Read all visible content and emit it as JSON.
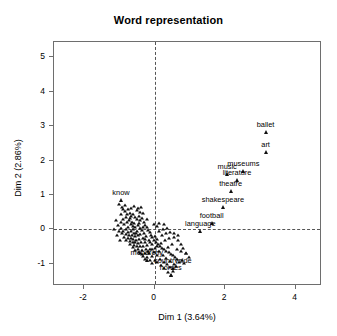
{
  "chart_data": {
    "type": "scatter",
    "title": "Word representation",
    "xlabel": "Dim 1 (3.64%)",
    "ylabel": "Dim 2 (2.86%)",
    "xlim": [
      -2.85,
      4.75
    ],
    "ylim": [
      -1.65,
      5.45
    ],
    "xticks": [
      "-2",
      "0",
      "2",
      "4"
    ],
    "xtick_values": [
      -2,
      0,
      2,
      4
    ],
    "yticks": [
      "-1",
      "0",
      "1",
      "2",
      "3",
      "4",
      "5"
    ],
    "ytick_values": [
      -1,
      0,
      1,
      2,
      3,
      4,
      5
    ],
    "grid": false,
    "reference_lines": {
      "vertical_x": 0,
      "horizontal_y": 0,
      "style": "dashed"
    },
    "marker": "triangle",
    "legend": "none",
    "labeled_points": [
      {
        "label": "ballet",
        "x": 3.15,
        "y": 2.82
      },
      {
        "label": "art",
        "x": 3.15,
        "y": 2.25
      },
      {
        "label": "museums",
        "x": 2.52,
        "y": 1.7
      },
      {
        "label": "music",
        "x": 2.06,
        "y": 1.62
      },
      {
        "label": "literature",
        "x": 2.34,
        "y": 1.43
      },
      {
        "label": "theatre",
        "x": 2.16,
        "y": 1.12
      },
      {
        "label": "shakespeare",
        "x": 1.94,
        "y": 0.66
      },
      {
        "label": "football",
        "x": 1.62,
        "y": 0.18
      },
      {
        "label": "language",
        "x": 1.3,
        "y": -0.05
      },
      {
        "label": "know",
        "x": -0.95,
        "y": 0.84
      },
      {
        "label": "monarchy",
        "x": -0.22,
        "y": -0.88
      },
      {
        "label": "countryside",
        "x": 0.52,
        "y": -1.12
      },
      {
        "label": "horses",
        "x": 0.46,
        "y": -1.32
      }
    ],
    "cluster_note": "dense unlabeled cluster of word points centered near (-0.3, -0.2)",
    "cluster_points": [
      [
        -1.02,
        0.74
      ],
      [
        -0.9,
        0.6
      ],
      [
        -0.84,
        0.52
      ],
      [
        -0.95,
        0.45
      ],
      [
        -0.76,
        0.58
      ],
      [
        -0.7,
        0.48
      ],
      [
        -0.66,
        0.4
      ],
      [
        -0.8,
        0.36
      ],
      [
        -0.88,
        0.3
      ],
      [
        -0.6,
        0.44
      ],
      [
        -0.55,
        0.35
      ],
      [
        -0.72,
        0.26
      ],
      [
        -0.64,
        0.22
      ],
      [
        -0.5,
        0.3
      ],
      [
        -0.45,
        0.4
      ],
      [
        -0.58,
        0.18
      ],
      [
        -0.68,
        0.14
      ],
      [
        -0.78,
        0.2
      ],
      [
        -0.86,
        0.16
      ],
      [
        -0.4,
        0.26
      ],
      [
        -0.35,
        0.34
      ],
      [
        -0.48,
        0.12
      ],
      [
        -0.54,
        0.06
      ],
      [
        -0.62,
        0.02
      ],
      [
        -0.74,
        0.06
      ],
      [
        -0.82,
        0.02
      ],
      [
        -0.3,
        0.2
      ],
      [
        -0.26,
        0.12
      ],
      [
        -0.42,
        0.04
      ],
      [
        -0.36,
        -0.02
      ],
      [
        -0.5,
        -0.06
      ],
      [
        -0.58,
        -0.1
      ],
      [
        -0.66,
        -0.06
      ],
      [
        -0.76,
        -0.08
      ],
      [
        -0.88,
        -0.04
      ],
      [
        -0.22,
        0.06
      ],
      [
        -0.18,
        -0.02
      ],
      [
        -0.3,
        -0.1
      ],
      [
        -0.4,
        -0.14
      ],
      [
        -0.48,
        -0.18
      ],
      [
        -0.56,
        -0.2
      ],
      [
        -0.64,
        -0.16
      ],
      [
        -0.72,
        -0.18
      ],
      [
        -0.8,
        -0.14
      ],
      [
        -0.14,
        -0.08
      ],
      [
        -0.1,
        -0.16
      ],
      [
        -0.24,
        -0.2
      ],
      [
        -0.34,
        -0.24
      ],
      [
        -0.44,
        -0.28
      ],
      [
        -0.52,
        -0.3
      ],
      [
        -0.6,
        -0.28
      ],
      [
        -0.68,
        -0.26
      ],
      [
        -0.76,
        -0.26
      ],
      [
        -0.06,
        -0.22
      ],
      [
        -0.02,
        -0.3
      ],
      [
        -0.16,
        -0.32
      ],
      [
        -0.28,
        -0.36
      ],
      [
        -0.38,
        -0.38
      ],
      [
        -0.46,
        -0.4
      ],
      [
        -0.54,
        -0.38
      ],
      [
        -0.62,
        -0.36
      ],
      [
        -0.7,
        -0.34
      ],
      [
        0.04,
        -0.36
      ],
      [
        0.1,
        -0.42
      ],
      [
        -0.08,
        -0.44
      ],
      [
        -0.2,
        -0.46
      ],
      [
        -0.32,
        -0.48
      ],
      [
        -0.42,
        -0.5
      ],
      [
        -0.5,
        -0.48
      ],
      [
        -0.58,
        -0.46
      ],
      [
        0.16,
        -0.48
      ],
      [
        0.22,
        -0.54
      ],
      [
        0.02,
        -0.54
      ],
      [
        -0.12,
        -0.56
      ],
      [
        -0.24,
        -0.58
      ],
      [
        -0.36,
        -0.6
      ],
      [
        -0.46,
        -0.58
      ],
      [
        0.28,
        -0.58
      ],
      [
        0.34,
        -0.64
      ],
      [
        0.12,
        -0.64
      ],
      [
        -0.02,
        -0.66
      ],
      [
        -0.16,
        -0.68
      ],
      [
        -0.28,
        -0.7
      ],
      [
        -0.4,
        -0.68
      ],
      [
        0.4,
        -0.66
      ],
      [
        0.46,
        -0.72
      ],
      [
        0.24,
        -0.74
      ],
      [
        0.06,
        -0.76
      ],
      [
        -0.08,
        -0.78
      ],
      [
        -0.22,
        -0.8
      ],
      [
        -0.34,
        -0.78
      ],
      [
        0.52,
        -0.76
      ],
      [
        0.58,
        -0.82
      ],
      [
        0.34,
        -0.84
      ],
      [
        0.16,
        -0.86
      ],
      [
        0.0,
        -0.88
      ],
      [
        -0.14,
        -0.9
      ],
      [
        -0.28,
        -0.86
      ],
      [
        0.64,
        -0.86
      ],
      [
        0.44,
        -0.92
      ],
      [
        0.26,
        -0.94
      ],
      [
        0.08,
        -0.96
      ],
      [
        -0.06,
        -0.98
      ],
      [
        0.7,
        -0.94
      ],
      [
        0.54,
        -1.0
      ],
      [
        0.36,
        -1.02
      ],
      [
        0.18,
        -1.04
      ],
      [
        0.62,
        -1.08
      ],
      [
        0.44,
        -1.1
      ],
      [
        0.28,
        -1.14
      ],
      [
        0.52,
        -1.2
      ],
      [
        0.38,
        -1.24
      ],
      [
        0.46,
        -1.34
      ],
      [
        -0.96,
        0.2
      ],
      [
        -1.04,
        0.12
      ],
      [
        -0.94,
        0.04
      ],
      [
        -1.0,
        -0.04
      ],
      [
        -0.92,
        -0.12
      ],
      [
        -0.86,
        -0.22
      ],
      [
        -0.8,
        -0.32
      ],
      [
        -0.7,
        -0.44
      ],
      [
        -0.62,
        -0.52
      ],
      [
        -0.54,
        -0.6
      ],
      [
        0.78,
        -0.9
      ],
      [
        0.84,
        -0.98
      ],
      [
        -0.44,
        -0.66
      ],
      [
        -0.36,
        -0.72
      ],
      [
        -0.18,
        -0.62
      ],
      [
        -0.06,
        -0.58
      ],
      [
        0.06,
        -0.5
      ],
      [
        0.18,
        -0.4
      ],
      [
        0.3,
        -0.32
      ],
      [
        0.42,
        -0.26
      ],
      [
        0.54,
        -0.22
      ],
      [
        0.66,
        -0.3
      ],
      [
        0.74,
        -0.42
      ],
      [
        0.82,
        -0.54
      ],
      [
        0.9,
        -0.68
      ],
      [
        0.2,
        -0.18
      ],
      [
        0.32,
        -0.12
      ],
      [
        0.44,
        -0.08
      ],
      [
        0.56,
        -0.12
      ],
      [
        0.68,
        -0.18
      ],
      [
        0.12,
        -0.06
      ],
      [
        0.24,
        0.0
      ],
      [
        0.36,
        0.04
      ],
      [
        0.06,
        0.1
      ],
      [
        -0.02,
        0.16
      ],
      [
        0.14,
        0.18
      ],
      [
        0.26,
        0.14
      ],
      [
        -0.66,
        0.62
      ],
      [
        -0.58,
        0.68
      ],
      [
        -0.5,
        0.56
      ],
      [
        -0.42,
        0.5
      ],
      [
        -0.34,
        0.46
      ],
      [
        -1.1,
        0.28
      ],
      [
        -1.14,
        0.0
      ],
      [
        -1.06,
        -0.18
      ],
      [
        -0.98,
        -0.3
      ],
      [
        0.98,
        -0.8
      ],
      [
        0.88,
        -0.7
      ],
      [
        0.76,
        -0.62
      ],
      [
        0.64,
        -0.56
      ],
      [
        0.5,
        -0.44
      ],
      [
        0.38,
        -0.52
      ],
      [
        -0.44,
        0.18
      ],
      [
        -0.26,
        -0.28
      ],
      [
        -0.12,
        -0.36
      ],
      [
        0.0,
        -0.2
      ],
      [
        0.08,
        -0.28
      ],
      [
        -0.7,
        0.32
      ],
      [
        -0.52,
        -0.12
      ],
      [
        -0.6,
        0.1
      ],
      [
        -0.34,
        0.08
      ],
      [
        -0.2,
        0.3
      ],
      [
        -0.46,
        0.62
      ],
      [
        -0.38,
        0.66
      ],
      [
        -0.78,
        0.44
      ],
      [
        -0.92,
        0.66
      ],
      [
        -0.84,
        0.7
      ]
    ]
  },
  "axis": {
    "title": "Word representation",
    "x_label": "Dim 1 (3.64%)",
    "y_label": "Dim 2 (2.86%)"
  }
}
